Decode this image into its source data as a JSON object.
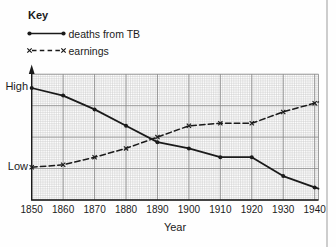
{
  "key": {
    "title": "Key",
    "items": [
      {
        "label": "deaths from TB",
        "style": "solid",
        "marker": "dot"
      },
      {
        "label": "earnings",
        "style": "dashed",
        "marker": "x"
      }
    ]
  },
  "chart_data": {
    "type": "line",
    "x": [
      1850,
      1860,
      1870,
      1880,
      1890,
      1900,
      1910,
      1920,
      1930,
      1940
    ],
    "xlabel": "Year",
    "y_axis": {
      "range": [
        0,
        100
      ],
      "labels": [
        {
          "text": "High",
          "value": 89
        },
        {
          "text": "Low",
          "value": 26
        }
      ]
    },
    "series": [
      {
        "name": "deaths from TB",
        "style": "solid",
        "marker": "dot",
        "values": [
          89,
          83,
          72,
          59,
          46,
          41,
          34,
          34,
          19,
          10
        ],
        "edge_value": 9
      },
      {
        "name": "earnings",
        "style": "dashed",
        "marker": "x",
        "values": [
          26,
          28,
          34,
          41,
          50,
          59,
          61,
          61,
          70,
          77
        ],
        "edge_value": 78
      }
    ],
    "grid": true,
    "colors": {
      "line": "#1a1a1a",
      "grid_fine": "#c7c7c7",
      "grid_heavy": "#858585",
      "text": "#1b1b1b"
    }
  }
}
